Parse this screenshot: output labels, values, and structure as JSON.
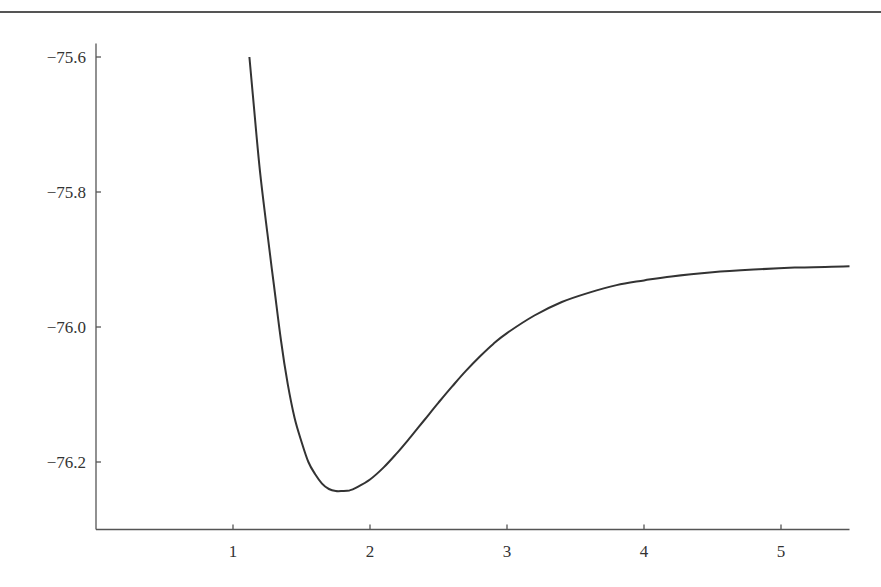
{
  "chart_data": {
    "type": "line",
    "title": "",
    "xlabel": "",
    "ylabel": "",
    "xlim": [
      0,
      5.5
    ],
    "ylim": [
      -76.3,
      -75.58
    ],
    "grid": false,
    "legend": null,
    "x_ticks": [
      1,
      2,
      3,
      4,
      5
    ],
    "x_tick_labels": [
      "1",
      "2",
      "3",
      "4",
      "5"
    ],
    "y_ticks": [
      -75.6,
      -75.8,
      -76.0,
      -76.2
    ],
    "y_tick_labels": [
      "−75.6",
      "−75.8",
      "−76.0",
      "−76.2"
    ],
    "series": [
      {
        "name": "potential energy curve",
        "color": "#333333",
        "x": [
          1.12,
          1.16,
          1.2,
          1.25,
          1.3,
          1.35,
          1.4,
          1.45,
          1.5,
          1.55,
          1.6,
          1.65,
          1.7,
          1.75,
          1.8,
          1.85,
          1.9,
          2.0,
          2.1,
          2.2,
          2.3,
          2.4,
          2.5,
          2.6,
          2.7,
          2.8,
          2.9,
          3.0,
          3.2,
          3.4,
          3.6,
          3.8,
          4.0,
          4.2,
          4.5,
          4.8,
          5.1,
          5.5
        ],
        "y": [
          -75.6,
          -75.69,
          -75.775,
          -75.86,
          -75.94,
          -76.02,
          -76.085,
          -76.135,
          -76.17,
          -76.2,
          -76.218,
          -76.232,
          -76.24,
          -76.243,
          -76.243,
          -76.242,
          -76.238,
          -76.226,
          -76.208,
          -76.186,
          -76.162,
          -76.137,
          -76.112,
          -76.088,
          -76.065,
          -76.044,
          -76.025,
          -76.009,
          -75.983,
          -75.963,
          -75.949,
          -75.938,
          -75.931,
          -75.925,
          -75.919,
          -75.915,
          -75.912,
          -75.91
        ]
      }
    ],
    "annotations": []
  }
}
